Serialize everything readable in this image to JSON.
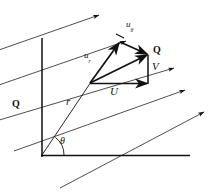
{
  "figure": {
    "kind": "vector-decomposition-diagram",
    "background_color": "#ffffff",
    "ink_color": "#111111",
    "width": 218,
    "height": 193
  },
  "labels": {
    "u_theta": {
      "base": "u",
      "sub": "θ",
      "x": 126,
      "y": 26,
      "size": 9,
      "style": "italic"
    },
    "u_r": {
      "base": "u",
      "sub": "r",
      "x": 85,
      "y": 57,
      "size": 9,
      "style": "italic"
    },
    "Q_vector": {
      "text": "Q",
      "x": 152,
      "y": 47,
      "size": 10,
      "style": "bold"
    },
    "Q_flow": {
      "text": "Q",
      "x": 12,
      "y": 99,
      "size": 10,
      "style": "bold"
    },
    "V": {
      "text": "V",
      "x": 152,
      "y": 63,
      "size": 11,
      "style": "italic"
    },
    "U": {
      "text": "U",
      "x": 110,
      "y": 86,
      "size": 11,
      "style": "italic"
    },
    "r": {
      "text": "r",
      "x": 66,
      "y": 97,
      "size": 11,
      "style": "italic"
    },
    "theta": {
      "text": "θ",
      "x": 60,
      "y": 137,
      "size": 10,
      "style": "italic"
    }
  },
  "axes": {
    "vertical": {
      "x": 42,
      "y_top": 38,
      "y_bottom": 157
    },
    "horizontal": {
      "y": 155,
      "x_left": 41,
      "x_right": 190
    }
  },
  "geometry": {
    "origin": {
      "x": 42,
      "y": 155
    },
    "field_point": {
      "x": 90,
      "y": 83
    },
    "u_theta_tip": {
      "x": 120,
      "y": 42
    },
    "q_tip": {
      "x": 148,
      "y": 55
    },
    "u_base_tip": {
      "x": 148,
      "y": 83
    },
    "theta_arc_radius": 22
  },
  "flow_lines": [
    {
      "x1": -4,
      "y1": 51,
      "x2": 101,
      "y2": 15
    },
    {
      "x1": -4,
      "y1": 86,
      "x2": 128,
      "y2": 40
    },
    {
      "x1": -4,
      "y1": 121,
      "x2": 176,
      "y2": 68
    },
    {
      "x1": 14,
      "y1": 151,
      "x2": 187,
      "y2": 90
    },
    {
      "x1": 60,
      "y1": 188,
      "x2": 206,
      "y2": 111
    }
  ],
  "arrow_count": 5
}
